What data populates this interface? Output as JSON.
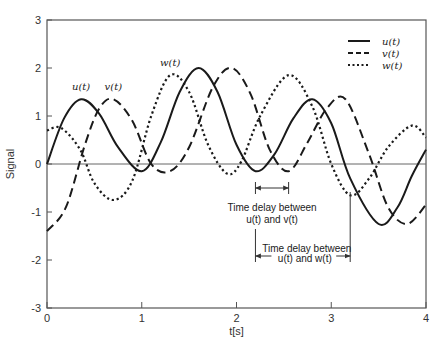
{
  "chart_data": {
    "type": "line",
    "title": "",
    "xlabel": "t[s]",
    "ylabel": "Signal",
    "xlim": [
      0,
      4
    ],
    "ylim": [
      -3,
      3
    ],
    "xticks": [
      "0",
      "1",
      "2",
      "3",
      "4"
    ],
    "yticks": [
      "-3",
      "-2",
      "-1",
      "0",
      "1",
      "2",
      "3"
    ],
    "grid": false,
    "legend_position": "upper right",
    "series": [
      {
        "name": "u(t)",
        "style": "solid",
        "x": [
          0,
          0.18,
          0.36,
          0.55,
          0.75,
          1.0,
          1.2,
          1.4,
          1.6,
          1.8,
          2.0,
          2.2,
          2.4,
          2.6,
          2.8,
          3.0,
          3.2,
          3.5,
          3.7,
          3.85,
          4.0
        ],
        "y": [
          0,
          0.95,
          1.35,
          1.05,
          0.35,
          -0.15,
          0.45,
          1.5,
          2.0,
          1.5,
          0.4,
          -0.15,
          0.2,
          0.95,
          1.35,
          0.85,
          -0.3,
          -1.25,
          -0.9,
          -0.25,
          0.3
        ]
      },
      {
        "name": "v(t)",
        "style": "dashed",
        "x": [
          0,
          0.2,
          0.4,
          0.55,
          0.7,
          0.9,
          1.1,
          1.3,
          1.5,
          1.75,
          1.95,
          2.15,
          2.35,
          2.55,
          2.75,
          2.95,
          3.15,
          3.4,
          3.6,
          3.8,
          4.0
        ],
        "y": [
          -1.4,
          -0.9,
          0.4,
          1.15,
          1.35,
          0.9,
          0.0,
          -0.15,
          0.35,
          1.6,
          2.0,
          1.45,
          0.3,
          -0.15,
          0.45,
          1.15,
          1.35,
          0.2,
          -0.9,
          -1.25,
          -0.85
        ]
      },
      {
        "name": "w(t)",
        "style": "dotted",
        "x": [
          0,
          0.15,
          0.35,
          0.5,
          0.7,
          0.9,
          1.1,
          1.3,
          1.5,
          1.7,
          1.9,
          2.05,
          2.25,
          2.55,
          2.8,
          3.0,
          3.2,
          3.4,
          3.6,
          3.85,
          4.0
        ],
        "y": [
          0.7,
          0.75,
          0.3,
          -0.4,
          -0.75,
          -0.35,
          1.0,
          1.85,
          1.5,
          0.4,
          -0.2,
          0.05,
          1.0,
          1.85,
          1.2,
          0.0,
          -0.65,
          -0.3,
          0.35,
          0.8,
          0.55
        ]
      }
    ],
    "curve_labels": [
      {
        "text": "u(t)",
        "x": 0.36,
        "y": 1.55
      },
      {
        "text": "v(t)",
        "x": 0.7,
        "y": 1.55
      },
      {
        "text": "w(t)",
        "x": 1.3,
        "y": 2.05
      }
    ],
    "annotations": [
      {
        "text_line1": "Time delay between",
        "text_line2": "u(t) and v(t)",
        "from_x": 2.2,
        "to_x": 2.55
      },
      {
        "text_line1": "Time delay between",
        "text_line2": "u(t) and w(t)",
        "from_x": 2.2,
        "to_x": 3.2
      }
    ]
  },
  "legend": [
    {
      "label": "u(t)",
      "style": "solid"
    },
    {
      "label": "v(t)",
      "style": "dashed"
    },
    {
      "label": "w(t)",
      "style": "dotted"
    }
  ]
}
